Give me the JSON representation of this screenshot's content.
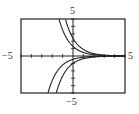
{
  "chart_data": {
    "type": "line",
    "title": "",
    "xlabel": "",
    "ylabel": "",
    "xlim": [
      -5,
      5
    ],
    "ylim": [
      -5,
      5
    ],
    "grid": false,
    "x_ticks_step": 1,
    "y_ticks_step": 1,
    "tick_labels": {
      "x_min": "−5",
      "x_max": "5",
      "y_max": "5",
      "y_min": "−5"
    },
    "series": [
      {
        "name": "upper-curve-1",
        "function": "y = 1.3*exp(-x)",
        "C": 1.3
      },
      {
        "name": "upper-curve-2",
        "function": "y = 2.4*exp(-x)",
        "C": 2.4
      },
      {
        "name": "lower-curve-1",
        "function": "y = -0.45*exp(-x)",
        "C": -0.45
      },
      {
        "name": "lower-curve-2",
        "function": "y = -1.0*exp(-x)",
        "C": -1.0
      }
    ],
    "colors": {
      "curve": "#222222",
      "axis": "#222222",
      "frame": "#222222"
    }
  }
}
